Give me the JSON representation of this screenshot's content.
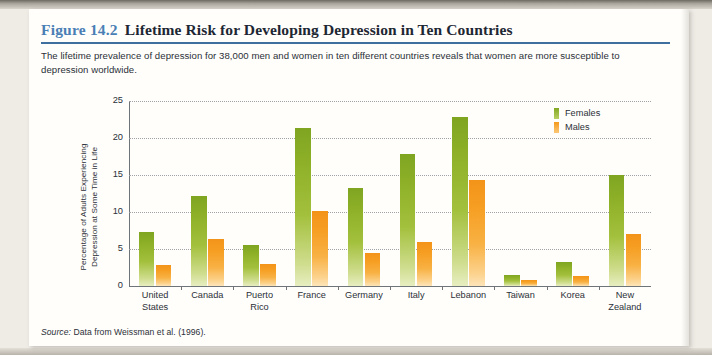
{
  "figure": {
    "number": "Figure 14.2",
    "title": "Lifetime Risk for Developing Depression in Ten Countries",
    "caption": "The lifetime prevalence of depression for 38,000 men and women in ten different countries reveals that women are more susceptible to depression worldwide.",
    "source_prefix": "Source:",
    "source_text": " Data from Weissman et al. (1996)."
  },
  "colors": {
    "accent_blue": "#4a7fb5",
    "rule_blue": "#3f6f9e",
    "females_green": "#8eb028",
    "males_orange": "#f69e22",
    "card_background": "#fffefb",
    "scan_background": "#efece6",
    "text": "#2b3038"
  },
  "chart_data": {
    "type": "bar",
    "title": "Lifetime Risk for Developing Depression in Ten Countries",
    "xlabel": "",
    "ylabel": "Percentage of Adults Experiencing Depression at Some Time in Life",
    "ylabel_line1": "Percentage of Adults Experiencing",
    "ylabel_line2": "Depression at Some Time in Life",
    "ylim": [
      0,
      25
    ],
    "yticks": [
      0,
      5,
      10,
      15,
      20,
      25
    ],
    "ytick_labels": [
      "0",
      "5",
      "10",
      "15",
      "20",
      "25"
    ],
    "grid": true,
    "legend_position": "top-right",
    "categories": [
      "United States",
      "Canada",
      "Puerto Rico",
      "France",
      "Germany",
      "Italy",
      "Lebanon",
      "Taiwan",
      "Korea",
      "New Zealand"
    ],
    "category_lines": [
      [
        "United",
        "States"
      ],
      [
        "Canada",
        ""
      ],
      [
        "Puerto",
        "Rico"
      ],
      [
        "France",
        ""
      ],
      [
        "Germany",
        ""
      ],
      [
        "Italy",
        ""
      ],
      [
        "Lebanon",
        ""
      ],
      [
        "Taiwan",
        ""
      ],
      [
        "Korea",
        ""
      ],
      [
        "New",
        "Zealand"
      ]
    ],
    "series": [
      {
        "name": "Females",
        "color": "#8eb028",
        "values": [
          7.3,
          12.2,
          5.5,
          21.3,
          13.3,
          17.9,
          22.8,
          1.5,
          3.3,
          15.0
        ]
      },
      {
        "name": "Males",
        "color": "#f69e22",
        "values": [
          2.8,
          6.3,
          3.0,
          10.2,
          4.5,
          5.9,
          14.3,
          0.8,
          1.3,
          7.0
        ]
      }
    ]
  }
}
